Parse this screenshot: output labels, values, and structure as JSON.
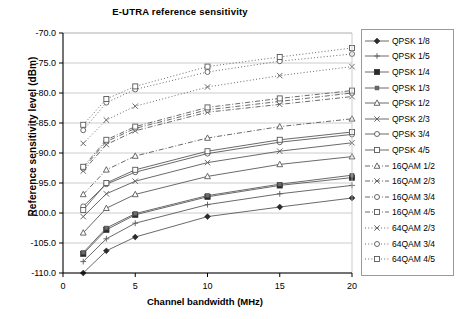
{
  "chart_data": {
    "type": "line",
    "title": "E-UTRA  reference sensitivity",
    "xlabel": "Channel bandwidth (MHz)",
    "ylabel": "Reference sensitivity level (dBm)",
    "xlim": [
      0,
      20
    ],
    "ylim": [
      -110.0,
      -70.0
    ],
    "xticks": [
      "0",
      "5",
      "10",
      "15",
      "20"
    ],
    "xtick_values": [
      0,
      5,
      10,
      15,
      20
    ],
    "yticks": [
      "-70.0",
      "-75.0",
      "-80.0",
      "-85.0",
      "-90.0",
      "-95.0",
      "-100.0",
      "-105.0",
      "-110.0"
    ],
    "ytick_values": [
      -70,
      -75,
      -80,
      -85,
      -90,
      -95,
      -100,
      -105,
      -110
    ],
    "grid": "horizontal",
    "legend_position": "right",
    "x": [
      1.4,
      3,
      5,
      10,
      15,
      20
    ],
    "series": [
      {
        "name": "QPSK 1/8",
        "marker": "diamond-filled",
        "line": "solid",
        "values": [
          -110.0,
          -106.3,
          -104.0,
          -100.6,
          -99.0,
          -97.5
        ]
      },
      {
        "name": "QPSK 1/5",
        "marker": "plus",
        "line": "solid",
        "values": [
          -108.1,
          -104.3,
          -101.7,
          -98.6,
          -96.8,
          -95.4
        ]
      },
      {
        "name": "QPSK 1/4",
        "marker": "square-filled",
        "line": "solid",
        "values": [
          -106.8,
          -102.8,
          -100.3,
          -97.3,
          -95.4,
          -94.1
        ]
      },
      {
        "name": "QPSK 1/3",
        "marker": "square-small-filled",
        "line": "solid",
        "values": [
          -106.6,
          -102.5,
          -100.1,
          -97.1,
          -95.2,
          -93.7
        ]
      },
      {
        "name": "QPSK 1/2",
        "marker": "triangle-open",
        "line": "solid",
        "values": [
          -103.3,
          -99.2,
          -96.9,
          -93.9,
          -91.9,
          -90.6
        ]
      },
      {
        "name": "QPSK 2/3",
        "marker": "cross-x",
        "line": "solid",
        "values": [
          -100.6,
          -96.8,
          -94.7,
          -91.6,
          -89.7,
          -88.3
        ]
      },
      {
        "name": "QPSK 3/4",
        "marker": "circle-open",
        "line": "solid",
        "values": [
          -98.9,
          -95.2,
          -93.2,
          -90.1,
          -88.2,
          -86.9
        ]
      },
      {
        "name": "QPSK 4/5",
        "marker": "square-open",
        "line": "solid",
        "values": [
          -99.5,
          -95.0,
          -92.8,
          -89.7,
          -87.8,
          -86.5
        ]
      },
      {
        "name": "16QAM 1/2",
        "marker": "triangle-open",
        "line": "dash-dot",
        "values": [
          -96.9,
          -92.8,
          -90.5,
          -87.5,
          -85.6,
          -84.3
        ]
      },
      {
        "name": "16QAM 2/3",
        "marker": "cross-x",
        "line": "dash-dot",
        "values": [
          -93.0,
          -88.6,
          -86.3,
          -83.2,
          -81.9,
          -80.6
        ]
      },
      {
        "name": "16QAM 3/4",
        "marker": "circle-open",
        "line": "dash-dot",
        "values": [
          -92.6,
          -88.1,
          -85.9,
          -82.8,
          -81.4,
          -80.0
        ]
      },
      {
        "name": "16QAM 4/5",
        "marker": "square-open",
        "line": "dash-dot",
        "values": [
          -92.3,
          -87.8,
          -85.6,
          -82.4,
          -80.9,
          -79.6
        ]
      },
      {
        "name": "64QAM 2/3",
        "marker": "cross-x",
        "line": "dotted",
        "values": [
          -88.4,
          -84.5,
          -82.2,
          -79.0,
          -77.1,
          -75.6
        ]
      },
      {
        "name": "64QAM 3/4",
        "marker": "circle-open",
        "line": "dotted",
        "values": [
          -86.2,
          -81.6,
          -79.4,
          -76.5,
          -74.7,
          -73.5
        ]
      },
      {
        "name": "64QAM 4/5",
        "marker": "square-open",
        "line": "dotted",
        "values": [
          -85.3,
          -81.0,
          -78.9,
          -75.6,
          -74.0,
          -72.5
        ]
      }
    ]
  },
  "colors": {
    "line": "#595959",
    "axis": "#000000",
    "grid": "#bfbfbf",
    "legend_border": "#9a9a9a"
  }
}
